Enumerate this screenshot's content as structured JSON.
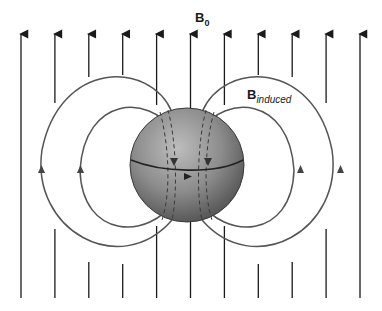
{
  "labels": {
    "applied_field": {
      "main": "B",
      "sub": "0"
    },
    "induced_field": {
      "main": "B",
      "sub": "induced"
    }
  },
  "figure": {
    "type": "magnetic-field-diagram",
    "applied_field_line_count": 11,
    "applied_field_direction": "up",
    "induced_loops_per_side": 2,
    "induced_loop_direction_outside": "up",
    "induced_field_inside_sphere_direction": "down",
    "sphere_equator_current_direction": "right"
  },
  "colors": {
    "line": "#1a1a1a",
    "loop": "#555555",
    "sphere_light": "#b5b5b5",
    "sphere_dark": "#555555",
    "background": "#ffffff"
  }
}
